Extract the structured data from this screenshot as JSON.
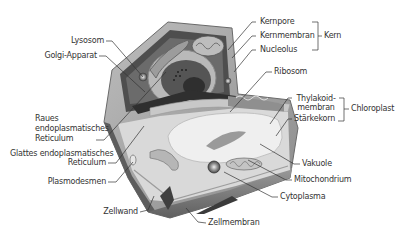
{
  "colors": {
    "background": "#ffffff",
    "cell_wall_outer": "#a9a9a9",
    "cell_wall_dark": "#5a5a5a",
    "cytoplasm": "#d6d6d6",
    "organelle_dark": "#4d4d4d",
    "vacuole": "#ececec",
    "leader_line": "#333333"
  },
  "labels": {
    "left": [
      {
        "id": "lysosom",
        "text": "Lysosom"
      },
      {
        "id": "golgi",
        "text": "Golgi-Apparat"
      },
      {
        "id": "raues_er_1",
        "text": "Raues"
      },
      {
        "id": "raues_er_2",
        "text": "endoplasmatisches"
      },
      {
        "id": "raues_er_3",
        "text": "Reticulum"
      },
      {
        "id": "glattes_er_1",
        "text": "Glattes endoplasmatisches"
      },
      {
        "id": "glattes_er_2",
        "text": "Reticulum"
      },
      {
        "id": "plasmodesmen",
        "text": "Plasmodesmen"
      },
      {
        "id": "zellwand",
        "text": "Zellwand"
      }
    ],
    "right": [
      {
        "id": "kernpore",
        "text": "Kernpore"
      },
      {
        "id": "kernmembran",
        "text": "Kernmembran"
      },
      {
        "id": "nucleolus",
        "text": "Nucleolus"
      },
      {
        "id": "ribosom",
        "text": "Ribosom"
      },
      {
        "id": "thylakoid_1",
        "text": "Thylakoid-"
      },
      {
        "id": "thylakoid_2",
        "text": "membran"
      },
      {
        "id": "staerkekorn",
        "text": "Stärkekorn"
      },
      {
        "id": "vakuole",
        "text": "Vakuole"
      },
      {
        "id": "mitochondrium",
        "text": "Mitochondrium"
      },
      {
        "id": "cytoplasma",
        "text": "Cytoplasma"
      }
    ],
    "bottom": [
      {
        "id": "zellmembran",
        "text": "Zellmembran"
      }
    ],
    "groups": [
      {
        "id": "kern",
        "text": "Kern"
      },
      {
        "id": "chloroplast",
        "text": "Chloroplast"
      }
    ]
  }
}
